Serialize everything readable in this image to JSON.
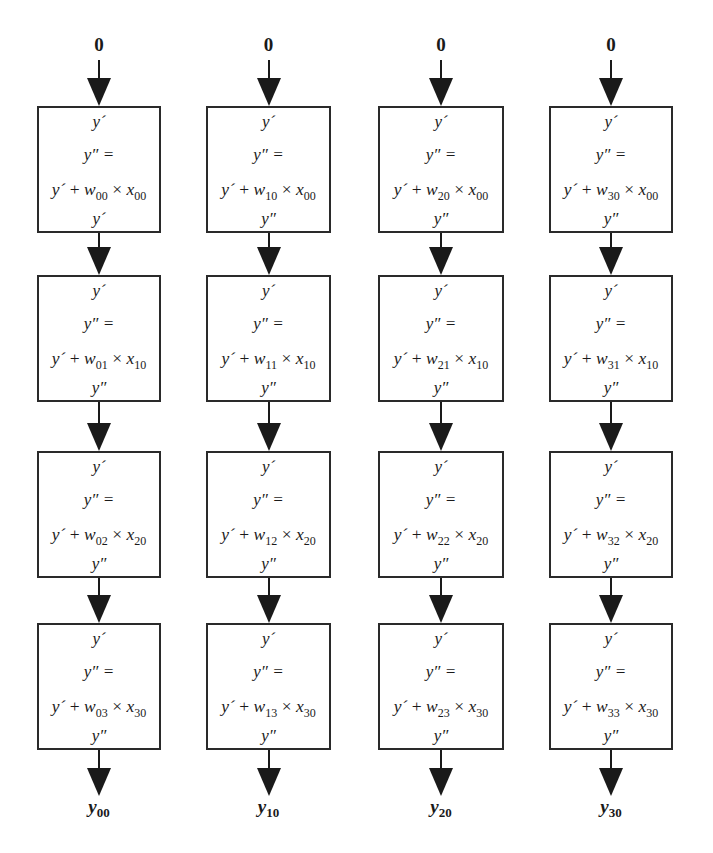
{
  "diagram": {
    "title": "",
    "columns": [
      {
        "input_label": "0",
        "output_label": {
          "base": "y",
          "sub": "00"
        },
        "cells": [
          {
            "in": "y´",
            "assign": "y″ =",
            "expr": {
              "y": "y´",
              "plus": "+",
              "w": "w",
              "w_sub": "00",
              "times": "×",
              "x": "x",
              "x_sub": "00"
            },
            "out": "y´"
          },
          {
            "in": "y´",
            "assign": "y″ =",
            "expr": {
              "y": "y´",
              "plus": "+",
              "w": "w",
              "w_sub": "01",
              "times": "×",
              "x": "x",
              "x_sub": "10"
            },
            "out": "y″"
          },
          {
            "in": "y´",
            "assign": "y″ =",
            "expr": {
              "y": "y´",
              "plus": "+",
              "w": "w",
              "w_sub": "02",
              "times": "×",
              "x": "x",
              "x_sub": "20"
            },
            "out": "y″"
          },
          {
            "in": "y´",
            "assign": "y″ =",
            "expr": {
              "y": "y´",
              "plus": "+",
              "w": "w",
              "w_sub": "03",
              "times": "×",
              "x": "x",
              "x_sub": "30"
            },
            "out": "y″"
          }
        ]
      },
      {
        "input_label": "0",
        "output_label": {
          "base": "y",
          "sub": "10"
        },
        "cells": [
          {
            "in": "y´",
            "assign": "y″ =",
            "expr": {
              "y": "y´",
              "plus": "+",
              "w": "w",
              "w_sub": "10",
              "times": "×",
              "x": "x",
              "x_sub": "00"
            },
            "out": "y″"
          },
          {
            "in": "y´",
            "assign": "y″ =",
            "expr": {
              "y": "y´",
              "plus": "+",
              "w": "w",
              "w_sub": "11",
              "times": "×",
              "x": "x",
              "x_sub": "10"
            },
            "out": "y″"
          },
          {
            "in": "y´",
            "assign": "y″ =",
            "expr": {
              "y": "y´",
              "plus": "+",
              "w": "w",
              "w_sub": "12",
              "times": "×",
              "x": "x",
              "x_sub": "20"
            },
            "out": "y″"
          },
          {
            "in": "y´",
            "assign": "y″ =",
            "expr": {
              "y": "y´",
              "plus": "+",
              "w": "w",
              "w_sub": "13",
              "times": "×",
              "x": "x",
              "x_sub": "30"
            },
            "out": "y″"
          }
        ]
      },
      {
        "input_label": "0",
        "output_label": {
          "base": "y",
          "sub": "20"
        },
        "cells": [
          {
            "in": "y´",
            "assign": "y″ =",
            "expr": {
              "y": "y´",
              "plus": "+",
              "w": "w",
              "w_sub": "20",
              "times": "×",
              "x": "x",
              "x_sub": "00"
            },
            "out": "y″"
          },
          {
            "in": "y´",
            "assign": "y″ =",
            "expr": {
              "y": "y´",
              "plus": "+",
              "w": "w",
              "w_sub": "21",
              "times": "×",
              "x": "x",
              "x_sub": "10"
            },
            "out": "y″"
          },
          {
            "in": "y´",
            "assign": "y″ =",
            "expr": {
              "y": "y´",
              "plus": "+",
              "w": "w",
              "w_sub": "22",
              "times": "×",
              "x": "x",
              "x_sub": "20"
            },
            "out": "y″"
          },
          {
            "in": "y´",
            "assign": "y″ =",
            "expr": {
              "y": "y´",
              "plus": "+",
              "w": "w",
              "w_sub": "23",
              "times": "×",
              "x": "x",
              "x_sub": "30"
            },
            "out": "y″"
          }
        ]
      },
      {
        "input_label": "0",
        "output_label": {
          "base": "y",
          "sub": "30"
        },
        "cells": [
          {
            "in": "y´",
            "assign": "y″ =",
            "expr": {
              "y": "y´",
              "plus": "+",
              "w": "w",
              "w_sub": "30",
              "times": "×",
              "x": "x",
              "x_sub": "00"
            },
            "out": "y″"
          },
          {
            "in": "y´",
            "assign": "y″ =",
            "expr": {
              "y": "y´",
              "plus": "+",
              "w": "w",
              "w_sub": "31",
              "times": "×",
              "x": "x",
              "x_sub": "10"
            },
            "out": "y″"
          },
          {
            "in": "y´",
            "assign": "y″ =",
            "expr": {
              "y": "y´",
              "plus": "+",
              "w": "w",
              "w_sub": "32",
              "times": "×",
              "x": "x",
              "x_sub": "20"
            },
            "out": "y″"
          },
          {
            "in": "y´",
            "assign": "y″ =",
            "expr": {
              "y": "y´",
              "plus": "+",
              "w": "w",
              "w_sub": "33",
              "times": "×",
              "x": "x",
              "x_sub": "30"
            },
            "out": "y″"
          }
        ]
      }
    ],
    "colors": {
      "stroke": "#2a2a2a",
      "arrow": "#1a1a1a",
      "background": "#ffffff"
    }
  }
}
